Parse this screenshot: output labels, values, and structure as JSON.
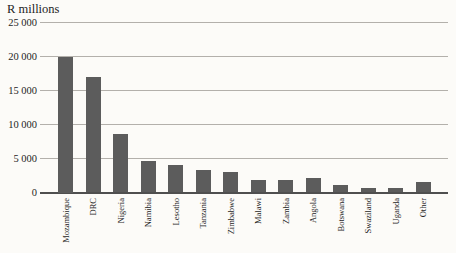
{
  "chart": {
    "unit_label": "R millions"
  },
  "colors": {
    "bar": "#5c5c5c",
    "gridline": "#b3b0ab",
    "axis": "#4f4f4f",
    "background": "#fcfbf8",
    "text": "#1e1e1e"
  },
  "chart_data": {
    "type": "bar",
    "title": "R millions",
    "categories": [
      "Mozambique",
      "DRC",
      "Nigeria",
      "Namibia",
      "Lesotho",
      "Tanzania",
      "Zimbabwe",
      "Malawi",
      "Zambia",
      "Angola",
      "Botswana",
      "Swaziland",
      "Uganda",
      "Other"
    ],
    "values": [
      20000,
      17000,
      8600,
      4700,
      4000,
      3300,
      3000,
      1800,
      1900,
      2100,
      1100,
      600,
      700,
      1600
    ],
    "xlabel": "",
    "ylabel": "R millions",
    "ylim": [
      0,
      25000
    ],
    "yticks": [
      0,
      5000,
      10000,
      15000,
      20000,
      25000
    ],
    "ytick_labels": [
      "0",
      "5 000",
      "10 000",
      "15 000",
      "20 000",
      "25 000"
    ],
    "grid": true,
    "legend": false,
    "bar_color": "#5c5c5c",
    "x_tick_rotation": -90
  }
}
